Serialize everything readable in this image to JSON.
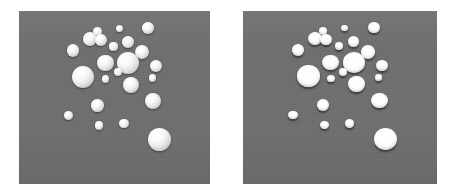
{
  "figure": {
    "background_color": "#ffffff",
    "width": 454,
    "height": 196
  },
  "panels": [
    {
      "id": "left-panel",
      "name": "smooth-sphere-render",
      "render_style": "sphere",
      "x": 19,
      "y": 11,
      "width": 191,
      "height": 173,
      "background_color": "#6f6f6f"
    },
    {
      "id": "right-panel",
      "name": "flat-disc-render",
      "render_style": "disc",
      "x": 243,
      "y": 11,
      "width": 194,
      "height": 173,
      "background_color": "#6f6f6f"
    }
  ],
  "blob_color": "#ffffff",
  "shadow_color": "#3a3a3a",
  "blobs": [
    {
      "cx": 0.412,
      "cy": 0.118,
      "r": 0.0225
    },
    {
      "cx": 0.525,
      "cy": 0.1,
      "r": 0.0185
    },
    {
      "cx": 0.676,
      "cy": 0.098,
      "r": 0.03
    },
    {
      "cx": 0.372,
      "cy": 0.16,
      "r": 0.036
    },
    {
      "cx": 0.427,
      "cy": 0.168,
      "r": 0.0315
    },
    {
      "cx": 0.57,
      "cy": 0.18,
      "r": 0.03
    },
    {
      "cx": 0.495,
      "cy": 0.205,
      "r": 0.0215
    },
    {
      "cx": 0.283,
      "cy": 0.228,
      "r": 0.032
    },
    {
      "cx": 0.645,
      "cy": 0.238,
      "r": 0.0375
    },
    {
      "cx": 0.452,
      "cy": 0.3,
      "r": 0.043
    },
    {
      "cx": 0.572,
      "cy": 0.3,
      "r": 0.057
    },
    {
      "cx": 0.718,
      "cy": 0.318,
      "r": 0.032
    },
    {
      "cx": 0.517,
      "cy": 0.355,
      "r": 0.0205
    },
    {
      "cx": 0.337,
      "cy": 0.38,
      "r": 0.058
    },
    {
      "cx": 0.453,
      "cy": 0.392,
      "r": 0.02
    },
    {
      "cx": 0.7,
      "cy": 0.388,
      "r": 0.019
    },
    {
      "cx": 0.585,
      "cy": 0.425,
      "r": 0.042
    },
    {
      "cx": 0.702,
      "cy": 0.52,
      "r": 0.043
    },
    {
      "cx": 0.412,
      "cy": 0.545,
      "r": 0.033
    },
    {
      "cx": 0.258,
      "cy": 0.602,
      "r": 0.0235
    },
    {
      "cx": 0.42,
      "cy": 0.662,
      "r": 0.022
    },
    {
      "cx": 0.55,
      "cy": 0.65,
      "r": 0.0245
    },
    {
      "cx": 0.735,
      "cy": 0.742,
      "r": 0.061
    }
  ]
}
